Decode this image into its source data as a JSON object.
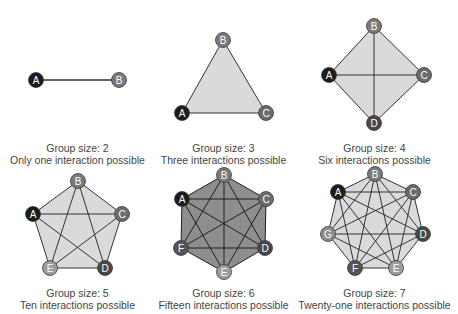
{
  "colors": {
    "A": "#1c1c1c",
    "B": "#7a7a7a",
    "C": "#6b6b6b",
    "D": "#474747",
    "E": "#9c9c9c",
    "F": "#555555",
    "G": "#8c8c8c",
    "edge": "#333333",
    "fill_light": "#dadada",
    "fill_dark": "#8e8e8e",
    "label": "#ffffff"
  },
  "groups": [
    {
      "size_label": "Group size: 2",
      "interactions_label": "Only one interaction possible",
      "fill": "fill_light",
      "caption_pos": [
        0,
        142
      ],
      "nodes": [
        {
          "id": "A",
          "x": 36,
          "y": 80
        },
        {
          "id": "B",
          "x": 119,
          "y": 80
        }
      ]
    },
    {
      "size_label": "Group size: 3",
      "interactions_label": "Three interactions possible",
      "fill": "fill_light",
      "caption_pos": [
        147,
        142
      ],
      "nodes": [
        {
          "id": "B",
          "x": 223,
          "y": 40
        },
        {
          "id": "C",
          "x": 266,
          "y": 113
        },
        {
          "id": "A",
          "x": 182,
          "y": 113
        }
      ]
    },
    {
      "size_label": "Group size: 4",
      "interactions_label": "Six interactions possible",
      "fill": "fill_light",
      "caption_pos": [
        300,
        142
      ],
      "nodes": [
        {
          "id": "B",
          "x": 374,
          "y": 26
        },
        {
          "id": "C",
          "x": 424,
          "y": 75
        },
        {
          "id": "D",
          "x": 374,
          "y": 123
        },
        {
          "id": "A",
          "x": 329,
          "y": 75
        }
      ]
    },
    {
      "size_label": "Group size: 5",
      "interactions_label": "Ten interactions possible",
      "fill": "fill_light",
      "caption_pos": [
        0,
        287
      ],
      "nodes": [
        {
          "id": "B",
          "x": 78,
          "y": 181
        },
        {
          "id": "C",
          "x": 122,
          "y": 214
        },
        {
          "id": "D",
          "x": 105,
          "y": 268
        },
        {
          "id": "E",
          "x": 50,
          "y": 268
        },
        {
          "id": "A",
          "x": 33,
          "y": 214
        }
      ]
    },
    {
      "size_label": "Group size: 6",
      "interactions_label": "Fifteen interactions possible",
      "fill": "fill_dark",
      "caption_pos": [
        147,
        287
      ],
      "nodes": [
        {
          "id": "B",
          "x": 224,
          "y": 175
        },
        {
          "id": "C",
          "x": 266,
          "y": 199
        },
        {
          "id": "D",
          "x": 265,
          "y": 248
        },
        {
          "id": "E",
          "x": 224,
          "y": 272
        },
        {
          "id": "F",
          "x": 181,
          "y": 248
        },
        {
          "id": "A",
          "x": 182,
          "y": 199
        }
      ]
    },
    {
      "size_label": "Group size: 7",
      "interactions_label": "Twenty-one interactions possible",
      "fill": "fill_light",
      "caption_pos": [
        300,
        287
      ],
      "nodes": [
        {
          "id": "B",
          "x": 375,
          "y": 174
        },
        {
          "id": "C",
          "x": 413,
          "y": 192
        },
        {
          "id": "D",
          "x": 423,
          "y": 234
        },
        {
          "id": "E",
          "x": 396,
          "y": 268
        },
        {
          "id": "F",
          "x": 355,
          "y": 268
        },
        {
          "id": "G",
          "x": 328,
          "y": 234
        },
        {
          "id": "A",
          "x": 338,
          "y": 192
        }
      ]
    }
  ]
}
